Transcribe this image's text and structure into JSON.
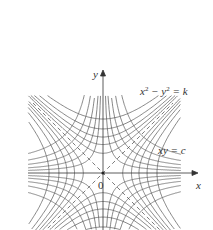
{
  "figure": {
    "origin_px": [
      103,
      173
    ],
    "scale_px_per_unit": 18,
    "x_axis": {
      "label": "x",
      "from_px": 28,
      "to_px": 198
    },
    "y_axis": {
      "label": "y",
      "from_px": 230,
      "to_px": 70
    },
    "origin_label": "0",
    "families": [
      {
        "name": "x2-y2-k",
        "label_base_x": "x",
        "label_base_y": "y",
        "label_exp": "2",
        "label_rest": " = k",
        "equation": "x^2 - y^2 = k",
        "k_values": [
          -9,
          -6,
          -4,
          -2.5,
          -1.2,
          1.2,
          2.5,
          4,
          6,
          9
        ]
      },
      {
        "name": "xy-c",
        "label": "xy = c",
        "equation": "xy = c",
        "c_values": [
          -4.5,
          -3,
          -2,
          -1.2,
          -0.6,
          0.6,
          1.2,
          2,
          3,
          4.5
        ]
      }
    ],
    "asymptotes": [
      "y = x",
      "y = -x"
    ],
    "colors": {
      "curve": "#555555",
      "axis": "#333333",
      "dash": "#444444",
      "text": "#333333"
    }
  }
}
